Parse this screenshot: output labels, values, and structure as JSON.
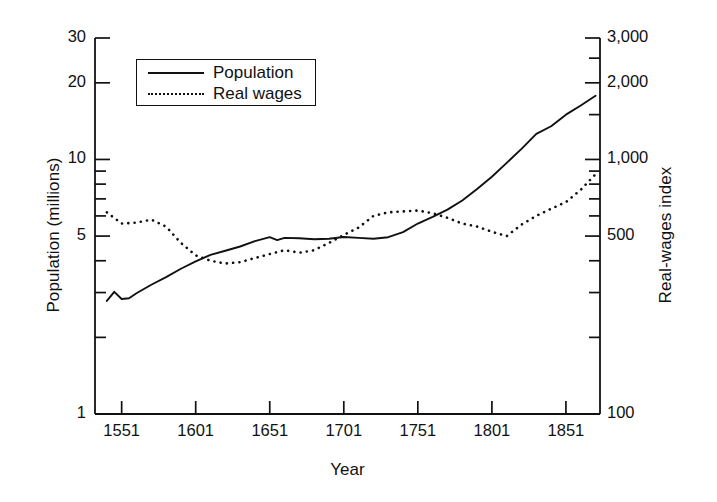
{
  "chart_data": {
    "type": "line",
    "title": "",
    "xlabel": "Year",
    "ylabel": "Population (millions)",
    "ylabel_right": "Real-wages index",
    "xlim": [
      1533,
      1874
    ],
    "ylim": [
      1,
      30
    ],
    "ylim_right": [
      100,
      3000
    ],
    "yscale": "log",
    "grid": false,
    "legend_position": "upper-left-inside",
    "xticks": [
      1551,
      1601,
      1651,
      1701,
      1751,
      1801,
      1851
    ],
    "xtick_labels": [
      "1551",
      "1601",
      "1651",
      "1701",
      "1751",
      "1801",
      "1851"
    ],
    "yticks_left_major": [
      1,
      5,
      10,
      20,
      30
    ],
    "ytick_labels_left": [
      "1",
      "5",
      "10",
      "20",
      "30"
    ],
    "yticks_left_minor": [
      2,
      3,
      4,
      6,
      7,
      8,
      9
    ],
    "yticks_right_major": [
      100,
      500,
      1000,
      2000,
      3000
    ],
    "ytick_labels_right": [
      "100",
      "500",
      "1,000",
      "2,000",
      "3,000"
    ],
    "series": [
      {
        "name": "Population",
        "style": "solid",
        "axis": "left",
        "units": "millions",
        "x": [
          1541,
          1546,
          1551,
          1556,
          1561,
          1571,
          1581,
          1591,
          1601,
          1611,
          1621,
          1631,
          1641,
          1651,
          1656,
          1661,
          1671,
          1681,
          1691,
          1701,
          1711,
          1721,
          1731,
          1741,
          1751,
          1761,
          1771,
          1781,
          1791,
          1801,
          1811,
          1821,
          1831,
          1841,
          1851,
          1861,
          1871
        ],
        "values": [
          2.78,
          3.02,
          2.83,
          2.85,
          2.98,
          3.22,
          3.45,
          3.72,
          3.98,
          4.22,
          4.38,
          4.55,
          4.78,
          4.95,
          4.82,
          4.92,
          4.9,
          4.86,
          4.88,
          4.96,
          4.92,
          4.88,
          4.95,
          5.18,
          5.6,
          5.95,
          6.35,
          6.9,
          7.65,
          8.55,
          9.7,
          11.0,
          12.6,
          13.5,
          15.0,
          16.3,
          17.8
        ]
      },
      {
        "name": "Real wages",
        "style": "dotted",
        "axis": "right",
        "units": "index",
        "x": [
          1541,
          1551,
          1561,
          1571,
          1581,
          1591,
          1601,
          1611,
          1621,
          1631,
          1641,
          1651,
          1661,
          1671,
          1681,
          1691,
          1701,
          1711,
          1721,
          1731,
          1741,
          1751,
          1761,
          1771,
          1781,
          1791,
          1801,
          1811,
          1821,
          1831,
          1841,
          1851,
          1861,
          1871
        ],
        "values": [
          620,
          560,
          565,
          580,
          545,
          470,
          420,
          400,
          390,
          395,
          410,
          425,
          440,
          430,
          440,
          470,
          505,
          540,
          600,
          620,
          625,
          630,
          615,
          590,
          560,
          545,
          520,
          500,
          555,
          600,
          640,
          680,
          760,
          875
        ]
      }
    ]
  },
  "legend": {
    "entries": [
      {
        "label": "Population",
        "key": "solid-line-key"
      },
      {
        "label": "Real wages",
        "key": "dotted-line-key"
      }
    ]
  }
}
